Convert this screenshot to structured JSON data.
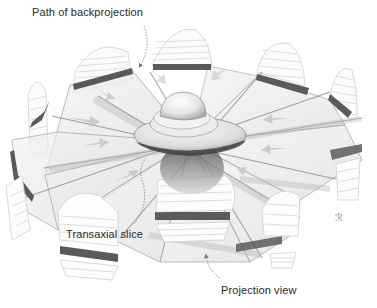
{
  "figure": {
    "labels": {
      "path_of_backprojection": "Path of backprojection",
      "transaxial_slice": "Transaxial slice",
      "projection_view": "Projection view"
    },
    "signature_mark": "ℛ",
    "projection_count": 10,
    "colors": {
      "background": "#ffffff",
      "plane_fill": "#e9e9e9",
      "plane_edge": "#9a9a9a",
      "dark_band": "#5a5a5a",
      "stripe_line": "#c8c8c8",
      "arrow_fill": "#c9c9c9",
      "object_light": "#f2f2f2",
      "object_shadow": "#7a7a7a",
      "text": "#2a2a2a"
    }
  }
}
